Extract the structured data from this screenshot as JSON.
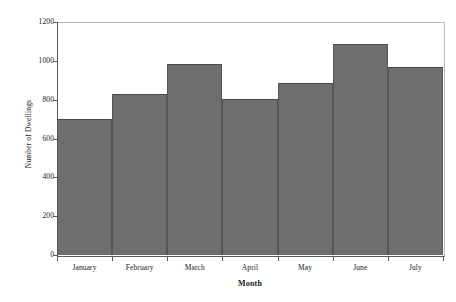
{
  "chart_data": {
    "type": "bar",
    "title": "",
    "xlabel": "Month",
    "ylabel": "Number of Dwellings",
    "categories": [
      "January",
      "February",
      "March",
      "April",
      "May",
      "June",
      "July"
    ],
    "values": [
      700,
      830,
      985,
      805,
      885,
      1085,
      970
    ],
    "ylim": [
      0,
      1200
    ],
    "yticks": [
      0,
      200,
      400,
      600,
      800,
      1000,
      1200
    ],
    "ytick_labels": [
      "0",
      "200",
      "400",
      "600",
      "800",
      "1000",
      "1200"
    ],
    "grid": false,
    "legend": null,
    "bar_color": "#6e6e6e",
    "bar_edge_color": "#4a4a4a",
    "axis_color": "#5a5a5a",
    "frame_color": "#b9b9b9",
    "background": "#ffffff"
  }
}
